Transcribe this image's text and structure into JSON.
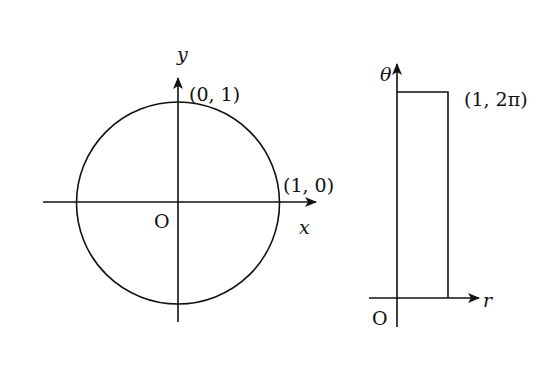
{
  "figure": {
    "left_panel": {
      "title": "Unit circle in xy-plane",
      "axes": {
        "x_label": "x",
        "y_label": "y",
        "origin_label": "O"
      },
      "points": [
        {
          "label": "(0, 1)",
          "x": 0,
          "y": 1
        },
        {
          "label": "(1, 0)",
          "x": 1,
          "y": 0
        }
      ],
      "shape": {
        "type": "circle",
        "center": [
          0,
          0
        ],
        "radius": 1
      }
    },
    "right_panel": {
      "title": "Rectangle in r-theta plane",
      "axes": {
        "x_label": "r",
        "y_label": "θ",
        "origin_label": "O"
      },
      "points": [
        {
          "label": "(1, 2π)",
          "r": 1,
          "theta": "2π"
        }
      ],
      "shape": {
        "type": "rectangle",
        "r_range": [
          0,
          1
        ],
        "theta_range": [
          "0",
          "2π"
        ]
      }
    }
  },
  "colors": {
    "stroke": "#111111",
    "background": "#ffffff"
  }
}
